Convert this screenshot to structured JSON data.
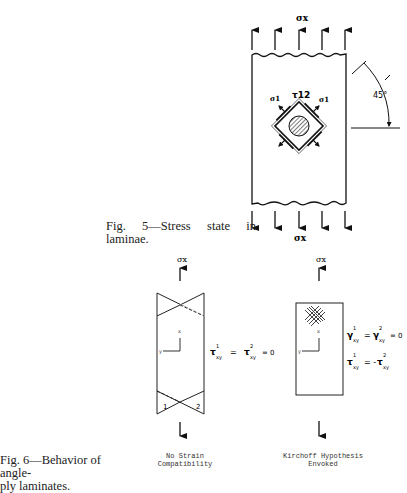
{
  "figure5": {
    "caption_line1": "Fig. 5—Stress state in",
    "caption_line2": "laminae.",
    "labels": {
      "sigma_top": "σx",
      "sigma_bottom": "σx",
      "tau12": "τ12",
      "angle": "45°",
      "sigma1_left": "σ1",
      "sigma1_right": "σ1"
    }
  },
  "figure6": {
    "caption_line1": "Fig. 6—Behavior of angle-",
    "caption_line2": "ply laminates.",
    "left_panel": {
      "sigma_top": "σx",
      "equation": "τ¹xy = τ²xy = 0",
      "ply_labels": [
        "1",
        "2"
      ],
      "label_line1": "No Strain",
      "label_line2": "Compatibility"
    },
    "right_panel": {
      "sigma_top": "σx",
      "equation1": "γ¹xy = γ²xy = 0",
      "equation2": "τ¹xy = -τ²xy",
      "label_line1": "Kirchoff Hypothesis",
      "label_line2": "Envoked"
    }
  }
}
